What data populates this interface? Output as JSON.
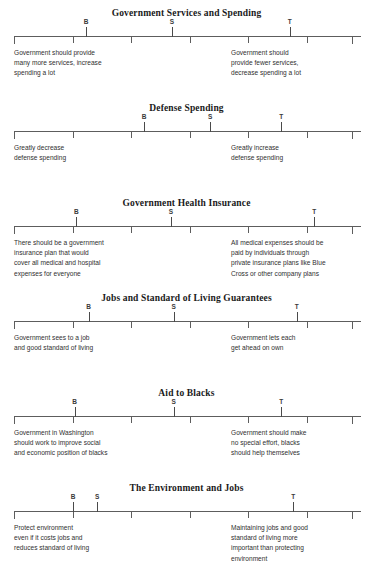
{
  "document": {
    "axis": {
      "tick_count": 7,
      "tick_positions_pct": [
        0,
        16.9,
        33.8,
        50.6,
        67.5,
        84.3,
        97.5
      ]
    },
    "marker_letters": {
      "B": "B",
      "S": "S",
      "T": "T"
    }
  },
  "issues": [
    {
      "title": "Government Services and Spending",
      "markers": [
        {
          "label": "B",
          "pos_pct": 20.8
        },
        {
          "label": "S",
          "pos_pct": 45.5
        },
        {
          "label": "T",
          "pos_pct": 79.5
        }
      ],
      "left_anchor": [
        "Government should provide",
        "many more services, increase",
        "spending a lot"
      ],
      "right_anchor": [
        "Government should",
        "provide fewer services,",
        "decrease spending a lot"
      ]
    },
    {
      "title": "Defense Spending",
      "markers": [
        {
          "label": "B",
          "pos_pct": 37.5
        },
        {
          "label": "S",
          "pos_pct": 56.5
        },
        {
          "label": "T",
          "pos_pct": 77.0
        }
      ],
      "left_anchor": [
        "Greatly decrease",
        "defense spending"
      ],
      "right_anchor": [
        "Greatly increase",
        "defense spending"
      ]
    },
    {
      "title": "Government Health Insurance",
      "markers": [
        {
          "label": "B",
          "pos_pct": 18.0
        },
        {
          "label": "S",
          "pos_pct": 45.2
        },
        {
          "label": "T",
          "pos_pct": 86.5
        }
      ],
      "left_anchor": [
        "There should be a government",
        "insurance plan that would",
        "cover all medical and hospital",
        "expenses for everyone"
      ],
      "right_anchor": [
        "All medical expenses should be",
        "paid by individuals through",
        "private insurance plans like Blue",
        "Cross or other company plans"
      ]
    },
    {
      "title": "Jobs and Standard of Living Guarantees",
      "markers": [
        {
          "label": "B",
          "pos_pct": 21.5
        },
        {
          "label": "S",
          "pos_pct": 46.0
        },
        {
          "label": "T",
          "pos_pct": 81.5
        }
      ],
      "left_anchor": [
        "Government sees to a job",
        "and good standard of living"
      ],
      "right_anchor": [
        "Government lets each",
        "get ahead on own"
      ]
    },
    {
      "title": "Aid to Blacks",
      "markers": [
        {
          "label": "B",
          "pos_pct": 17.5
        },
        {
          "label": "S",
          "pos_pct": 46.0
        },
        {
          "label": "T",
          "pos_pct": 77.0
        }
      ],
      "left_anchor": [
        "Government  in Washington",
        "should work to improve social",
        "and economic position of blacks"
      ],
      "right_anchor": [
        "Government should make",
        "no special effort, blacks",
        "should help themselves"
      ]
    },
    {
      "title": "The Environment and Jobs",
      "markers": [
        {
          "label": "B",
          "pos_pct": 17.0
        },
        {
          "label": "S",
          "pos_pct": 24.0
        },
        {
          "label": "T",
          "pos_pct": 80.5
        }
      ],
      "left_anchor": [
        "Protect environment",
        "even if it costs jobs and",
        "reduces standard of living"
      ],
      "right_anchor": [
        "Maintaining jobs and good",
        "standard of living more",
        "important than protecting",
        "environment"
      ]
    }
  ],
  "layout": {
    "issue_tops": [
      8,
      103,
      198,
      293,
      388,
      483
    ]
  }
}
